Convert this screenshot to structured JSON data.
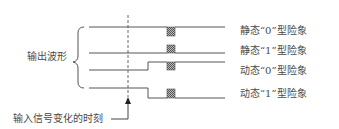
{
  "diagram": {
    "group_label": "输出波形",
    "input_change_label": "输入信号变化的时刻",
    "rows": [
      {
        "label": "静态“0”型险象"
      },
      {
        "label": "静态“1”型险象"
      },
      {
        "label": "动态“0”型险象"
      },
      {
        "label": "动态“1”型险象"
      }
    ],
    "colors": {
      "line": "#555555",
      "hatch": "#777777",
      "text": "#4a4a4a"
    }
  }
}
